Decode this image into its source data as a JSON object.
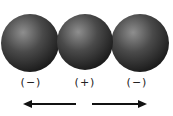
{
  "diagram": {
    "spheres": [
      {
        "id": "left",
        "cx": 30,
        "cy": 43,
        "r": 29,
        "charge": "(−)"
      },
      {
        "id": "middle",
        "cx": 85,
        "cy": 42,
        "r": 28,
        "charge": "(+)"
      },
      {
        "id": "right",
        "cx": 140,
        "cy": 43,
        "r": 29,
        "charge": "(−)"
      }
    ],
    "arrows": [
      {
        "id": "left-arrow",
        "direction": "left",
        "x1": 76,
        "x2": 24,
        "y": 104
      },
      {
        "id": "right-arrow",
        "direction": "right",
        "x1": 92,
        "x2": 146,
        "y": 104
      }
    ],
    "colors": {
      "sphere_light": "#8a8a8a",
      "sphere_dark": "#1c1c1c",
      "arrow": "#111111"
    }
  }
}
